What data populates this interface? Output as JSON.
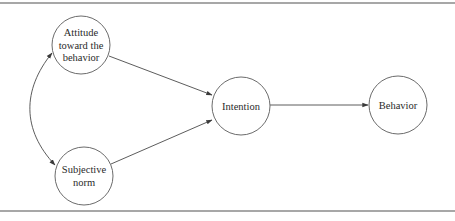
{
  "diagram": {
    "type": "path-diagram",
    "nodes": [
      {
        "id": "attitude",
        "lines": [
          "Attitude",
          "toward the",
          "behavior"
        ],
        "cx": 81,
        "cy": 45,
        "r": 29
      },
      {
        "id": "subjective_norm",
        "lines": [
          "Subjective",
          "norm"
        ],
        "cx": 84,
        "cy": 176,
        "r": 29
      },
      {
        "id": "intention",
        "lines": [
          "Intention"
        ],
        "cx": 241,
        "cy": 106,
        "r": 29
      },
      {
        "id": "behavior",
        "lines": [
          "Behavior"
        ],
        "cx": 398,
        "cy": 105,
        "r": 29
      }
    ],
    "edges": [
      {
        "from": "attitude",
        "to": "intention",
        "kind": "directed"
      },
      {
        "from": "subjective_norm",
        "to": "intention",
        "kind": "directed"
      },
      {
        "from": "intention",
        "to": "behavior",
        "kind": "directed"
      },
      {
        "from": "attitude",
        "to": "subjective_norm",
        "kind": "bidirectional-curved"
      }
    ]
  },
  "colors": {
    "stroke": "#6b6b6b",
    "text": "#2a2a2a",
    "rule": "#8a8a8a",
    "background": "#ffffff"
  }
}
